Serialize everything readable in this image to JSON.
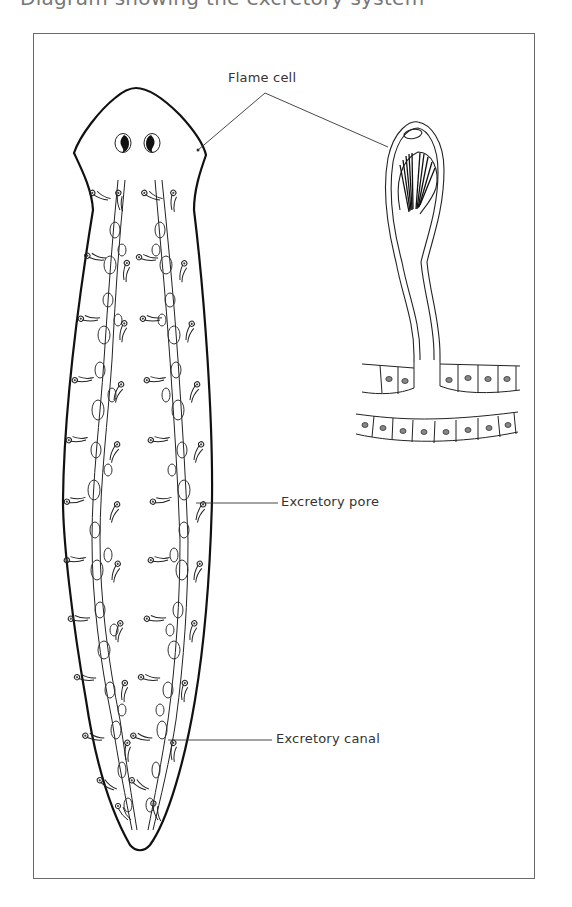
{
  "caption": {
    "text": "Diagram showing the excretory system",
    "note": "top caption is cropped; only lower part of glyphs visible"
  },
  "figure": {
    "labels": {
      "flame_cell": "Flame cell",
      "excretory_pore": "Excretory pore",
      "excretory_canal": "Excretory canal"
    },
    "colors": {
      "ink": "#1a1a1a",
      "frame": "#6a6a6a",
      "background": "#ffffff"
    }
  }
}
